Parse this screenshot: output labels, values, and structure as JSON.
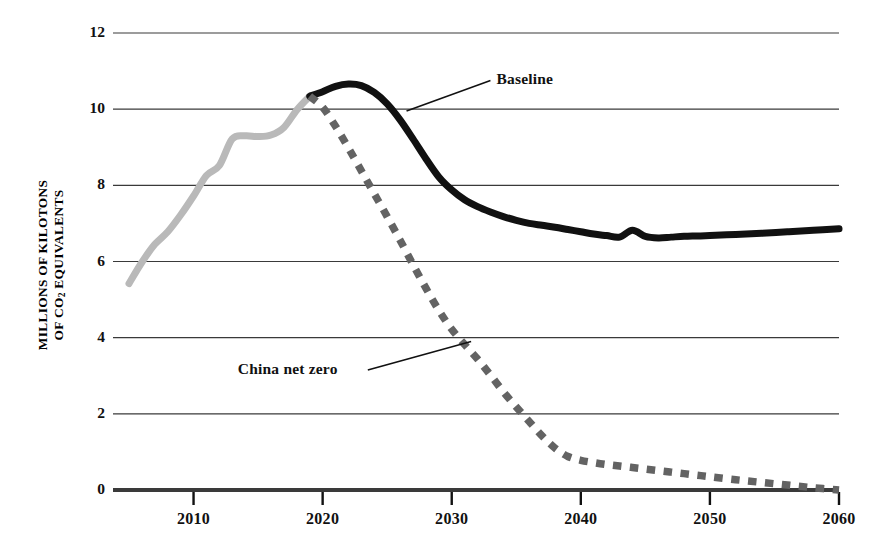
{
  "chart_data": {
    "type": "line",
    "title": "",
    "xlabel": "",
    "ylabel": "MILLIONS OF KILOTONS OF CO2 EQUIVALENTS",
    "ylabel_line1": "MILLIONS OF KILOTONS",
    "ylabel_line2_pre": "OF CO",
    "ylabel_line2_sub": "2",
    "ylabel_line2_post": " EQUIVALENTS",
    "xlim": [
      2005,
      2060
    ],
    "ylim": [
      0,
      12
    ],
    "grid": true,
    "legend_position": "inline-annotations",
    "x_ticks": [
      2010,
      2020,
      2030,
      2040,
      2050,
      2060
    ],
    "x_tick_labels": [
      "2010",
      "2020",
      "2030",
      "2040",
      "2050",
      "2060"
    ],
    "y_ticks": [
      0,
      2,
      4,
      6,
      8,
      10,
      12
    ],
    "y_tick_labels": [
      "0",
      "2",
      "4",
      "6",
      "8",
      "10",
      "12"
    ],
    "annotations": [
      {
        "text": "Baseline",
        "x": 2033,
        "y": 10.75,
        "target_x": 2026.5,
        "target_y": 9.95
      },
      {
        "text": "China net zero",
        "x": 2023.5,
        "y": 3.15,
        "target_x": 2031.5,
        "target_y": 3.9
      }
    ],
    "series": [
      {
        "name": "Historical",
        "color": "#b9b9b9",
        "style": "solid",
        "width": 7,
        "points": [
          [
            2005,
            5.42
          ],
          [
            2006,
            5.98
          ],
          [
            2007,
            6.45
          ],
          [
            2008,
            6.78
          ],
          [
            2009,
            7.22
          ],
          [
            2010,
            7.72
          ],
          [
            2011,
            8.26
          ],
          [
            2012,
            8.52
          ],
          [
            2013,
            9.22
          ],
          [
            2014,
            9.3
          ],
          [
            2015,
            9.28
          ],
          [
            2016,
            9.32
          ],
          [
            2017,
            9.52
          ],
          [
            2018,
            9.98
          ],
          [
            2019,
            10.34
          ]
        ]
      },
      {
        "name": "Baseline",
        "color": "#111111",
        "style": "solid",
        "width": 7,
        "points": [
          [
            2019,
            10.34
          ],
          [
            2020,
            10.46
          ],
          [
            2021,
            10.6
          ],
          [
            2022,
            10.66
          ],
          [
            2023,
            10.62
          ],
          [
            2024,
            10.44
          ],
          [
            2025,
            10.14
          ],
          [
            2026,
            9.72
          ],
          [
            2027,
            9.22
          ],
          [
            2028,
            8.7
          ],
          [
            2029,
            8.22
          ],
          [
            2030,
            7.88
          ],
          [
            2031,
            7.62
          ],
          [
            2032,
            7.44
          ],
          [
            2033,
            7.3
          ],
          [
            2034,
            7.18
          ],
          [
            2035,
            7.08
          ],
          [
            2036,
            7.0
          ],
          [
            2037,
            6.95
          ],
          [
            2038,
            6.9
          ],
          [
            2039,
            6.84
          ],
          [
            2040,
            6.78
          ],
          [
            2041,
            6.72
          ],
          [
            2042,
            6.68
          ],
          [
            2043,
            6.64
          ],
          [
            2044,
            6.82
          ],
          [
            2045,
            6.66
          ],
          [
            2046,
            6.62
          ],
          [
            2047,
            6.64
          ],
          [
            2048,
            6.66
          ],
          [
            2049,
            6.67
          ],
          [
            2050,
            6.68
          ],
          [
            2052,
            6.71
          ],
          [
            2054,
            6.74
          ],
          [
            2056,
            6.78
          ],
          [
            2058,
            6.82
          ],
          [
            2060,
            6.86
          ]
        ]
      },
      {
        "name": "China net zero",
        "color": "#636363",
        "style": "dashed",
        "width": 7.5,
        "points": [
          [
            2019,
            10.34
          ],
          [
            2020,
            10.05
          ],
          [
            2021,
            9.55
          ],
          [
            2022,
            8.98
          ],
          [
            2023,
            8.38
          ],
          [
            2024,
            7.78
          ],
          [
            2025,
            7.18
          ],
          [
            2026,
            6.56
          ],
          [
            2027,
            5.92
          ],
          [
            2028,
            5.3
          ],
          [
            2029,
            4.72
          ],
          [
            2030,
            4.22
          ],
          [
            2031,
            3.82
          ],
          [
            2032,
            3.44
          ],
          [
            2033,
            3.02
          ],
          [
            2034,
            2.58
          ],
          [
            2035,
            2.18
          ],
          [
            2036,
            1.8
          ],
          [
            2037,
            1.42
          ],
          [
            2038,
            1.1
          ],
          [
            2039,
            0.88
          ],
          [
            2040,
            0.78
          ],
          [
            2041,
            0.72
          ],
          [
            2042,
            0.67
          ],
          [
            2043,
            0.63
          ],
          [
            2044,
            0.59
          ],
          [
            2045,
            0.55
          ],
          [
            2046,
            0.51
          ],
          [
            2047,
            0.47
          ],
          [
            2048,
            0.43
          ],
          [
            2049,
            0.39
          ],
          [
            2050,
            0.35
          ],
          [
            2052,
            0.27
          ],
          [
            2054,
            0.2
          ],
          [
            2056,
            0.13
          ],
          [
            2058,
            0.06
          ],
          [
            2060,
            0.0
          ]
        ]
      }
    ]
  },
  "axis": {
    "baseline_color": "#111111",
    "gridline_color": "#3a3a3a"
  }
}
